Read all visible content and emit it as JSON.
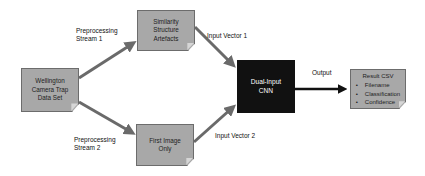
{
  "diagram": {
    "nodes": {
      "dataset": {
        "lines": [
          "Wellington",
          "Camera Trap",
          "Data Set"
        ]
      },
      "similarity": {
        "lines": [
          "Similarity",
          "Structure",
          "Artefacts"
        ]
      },
      "first_image": {
        "lines": [
          "First Image",
          "Only"
        ]
      },
      "cnn": {
        "lines": [
          "Dual-Input",
          "CNN"
        ]
      },
      "result": {
        "title": "Result CSV",
        "bullets": [
          "Filename",
          "Classification",
          "Confidence"
        ]
      }
    },
    "edges": {
      "stream1": {
        "lines": [
          "Preprocessing",
          "Stream 1"
        ]
      },
      "stream2": {
        "lines": [
          "Preprocessing",
          "Stream 2"
        ]
      },
      "vector1": {
        "label": "Input Vector 1"
      },
      "vector2": {
        "label": "Input Vector 2"
      },
      "output": {
        "label": "Output"
      }
    },
    "colors": {
      "node_fill": "#a8a8a8",
      "node_border": "#6c6c6c",
      "cnn_fill": "#111111",
      "arrow": "#6a6a6a",
      "output_arrow": "#111111"
    }
  }
}
